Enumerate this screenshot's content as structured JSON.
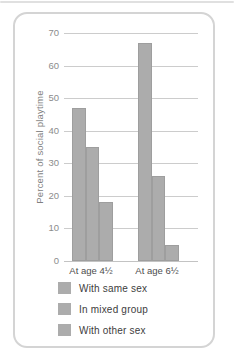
{
  "chart_data": {
    "type": "bar",
    "title": "",
    "ylabel": "Percent of social playtime",
    "xlabel": "",
    "ylim": [
      0,
      70
    ],
    "yticks": [
      70,
      60,
      50,
      40,
      30,
      20,
      10,
      0
    ],
    "grid": true,
    "categories": [
      "At age 4½",
      "At age 6½"
    ],
    "series": [
      {
        "name": "With same sex",
        "values": [
          47,
          67
        ]
      },
      {
        "name": "In mixed group",
        "values": [
          35,
          26
        ]
      },
      {
        "name": "With other sex",
        "values": [
          18,
          5
        ]
      }
    ],
    "bar_color": "#acacac",
    "grid_color": "#cccccc",
    "axis_line_color": "#c3c3c3",
    "legend_position": "bottom-left"
  }
}
